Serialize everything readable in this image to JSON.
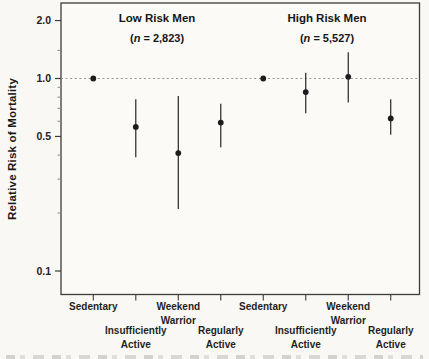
{
  "chart_data": {
    "type": "scatter",
    "subtype": "forest-plot-point-estimates-with-95ci",
    "y_scale": "log",
    "ylabel": "Relative Risk of Mortality",
    "ylim": [
      0.075,
      2.5
    ],
    "grid": false,
    "legend": null,
    "reference_line": 1.0,
    "y_major_ticks": [
      {
        "value": 2.0,
        "label": "2.0"
      },
      {
        "value": 1.0,
        "label": "1.0"
      },
      {
        "value": 0.5,
        "label": "0.5"
      },
      {
        "value": 0.1,
        "label": "0.1"
      }
    ],
    "y_minor_ticks": [
      1.4,
      0.9,
      0.8,
      0.7,
      0.6,
      0.4,
      0.3,
      0.2
    ],
    "categories": [
      [
        "Sedentary"
      ],
      [
        "Insufficiently",
        "Active"
      ],
      [
        "Weekend",
        "Warrior"
      ],
      [
        "Regularly",
        "Active"
      ]
    ],
    "category_label_row": [
      0,
      1,
      0,
      1
    ],
    "groups": [
      {
        "title": "Low Risk Men",
        "n_label": "(n = 2,823)",
        "points": [
          {
            "category": "Sedentary",
            "rr": 1.0,
            "ci_low": null,
            "ci_high": null
          },
          {
            "category": "Insufficiently Active",
            "rr": 0.56,
            "ci_low": 0.39,
            "ci_high": 0.78
          },
          {
            "category": "Weekend Warrior",
            "rr": 0.41,
            "ci_low": 0.21,
            "ci_high": 0.81
          },
          {
            "category": "Regularly Active",
            "rr": 0.59,
            "ci_low": 0.44,
            "ci_high": 0.74
          }
        ]
      },
      {
        "title": "High Risk Men",
        "n_label": "(n = 5,527)",
        "points": [
          {
            "category": "Sedentary",
            "rr": 1.0,
            "ci_low": null,
            "ci_high": null
          },
          {
            "category": "Insufficiently Active",
            "rr": 0.85,
            "ci_low": 0.66,
            "ci_high": 1.07
          },
          {
            "category": "Weekend Warrior",
            "rr": 1.02,
            "ci_low": 0.75,
            "ci_high": 1.37
          },
          {
            "category": "Regularly Active",
            "rr": 0.62,
            "ci_low": 0.51,
            "ci_high": 0.78
          }
        ]
      }
    ],
    "colors": {
      "ink": "#1c1c1c",
      "axis": "#3c3c3c",
      "minor_tick": "#8a8a8a",
      "reference_dash": "#979490",
      "plot_background": "#fbfaf6",
      "page_background": "#f9f8f4"
    }
  }
}
